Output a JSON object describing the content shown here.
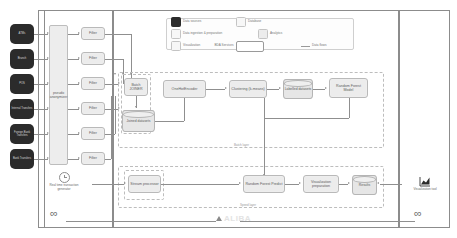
{
  "diagram": {
    "type": "architecture-diagram"
  },
  "legend": {
    "items": [
      {
        "label": "Data sources",
        "swatch": "dark"
      },
      {
        "label": "Database",
        "swatch": "light"
      },
      {
        "label": "Data ingestion & preparation",
        "swatch": "light"
      },
      {
        "label": "Analytics",
        "swatch": "light"
      },
      {
        "label": "Visualization",
        "swatch": "light"
      },
      {
        "label": "BDA Services",
        "swatch": "service"
      },
      {
        "label": "Data flows",
        "swatch": "line"
      }
    ]
  },
  "sources": {
    "nodes": [
      {
        "label": "ATMs"
      },
      {
        "label": "Branch"
      },
      {
        "label": "POS"
      },
      {
        "label": "Internal Transfers"
      },
      {
        "label": "Foreign Bank Transfers"
      },
      {
        "label": "Bank Transfers"
      }
    ]
  },
  "ingestion": {
    "anonymizer": "pseudo anonymizer",
    "filters": [
      {
        "label": "Filter"
      },
      {
        "label": "Filter"
      },
      {
        "label": "Filter"
      },
      {
        "label": "Filter"
      },
      {
        "label": "Filter"
      },
      {
        "label": "Filter"
      }
    ]
  },
  "generator": {
    "label": "Real time transaction generator",
    "icon": "clock-icon"
  },
  "batch_layer": {
    "label": "Batch layer",
    "nodes": [
      {
        "id": "batch-joiner",
        "label": "Batch JOINER",
        "shape": "box"
      },
      {
        "id": "onehotencoder",
        "label": "OneHotEncoder",
        "shape": "box"
      },
      {
        "id": "joined-datasets",
        "label": "Joined datasets",
        "shape": "cylinder"
      },
      {
        "id": "clustering",
        "label": "Clustering (k-means)",
        "shape": "box"
      },
      {
        "id": "labelled-datasets",
        "label": "Labelled datasets",
        "shape": "cylinder"
      },
      {
        "id": "random-forest-model",
        "label": "Random Forest Model",
        "shape": "box"
      }
    ]
  },
  "speed_layer": {
    "label": "Speed layer",
    "nodes": [
      {
        "id": "stream-processor",
        "label": "Stream processor",
        "shape": "box"
      },
      {
        "id": "random-forest-predict",
        "label": "Random Forest Predict",
        "shape": "box"
      },
      {
        "id": "visualization-preparation",
        "label": "Visualization preparation",
        "shape": "box"
      },
      {
        "id": "results",
        "label": "Results",
        "shape": "cylinder"
      }
    ]
  },
  "serving_layer": {
    "tool_label": "Visualization tool",
    "icon": "chart-icon"
  },
  "colors": {
    "source_fill": "#2b2b2b",
    "box_fill": "#ececec",
    "box_border": "#b9b9b9",
    "line": "#8f8f8f",
    "frame": "#8c8c8c",
    "dash": "#bdbdbd"
  }
}
